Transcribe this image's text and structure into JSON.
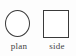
{
  "figure": {
    "background_color": "#fdfdfd",
    "stroke_color": "#3a3a3a",
    "text_color": "#444444",
    "views": [
      {
        "id": "plan",
        "label": "plan",
        "shape": "circle-outline"
      },
      {
        "id": "side",
        "label": "side",
        "shape": "square-outline"
      }
    ]
  }
}
